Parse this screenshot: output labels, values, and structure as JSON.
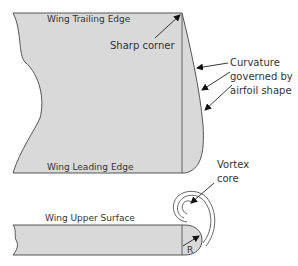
{
  "labels": {
    "trailing_edge": "Wing Trailing Edge",
    "sharp_corner": "Sharp corner",
    "curvature_line1": "Curvature",
    "curvature_line2": "governed by",
    "curvature_line3": "airfoil shape",
    "leading_edge": "Wing Leading Edge",
    "vortex_line1": "Vortex",
    "vortex_line2": "core",
    "upper_surface": "Wing Upper Surface",
    "radius": "R"
  },
  "colors": {
    "fill": "#d9d9d9",
    "stroke": "#555555",
    "text": "#333333"
  }
}
